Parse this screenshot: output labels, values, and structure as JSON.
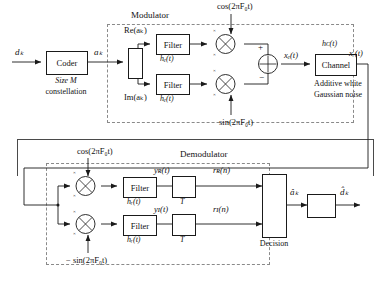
{
  "diagram": {
    "groups": {
      "modulator": "Modulator",
      "demodulator": "Demodulator"
    },
    "blocks": {
      "coder": "Coder",
      "coder_caption_line1": "Size M",
      "coder_caption_line2": "constellation",
      "splitter": "",
      "filter_i_tx": "Filter",
      "filter_q_tx": "Filter",
      "channel": "Channel",
      "channel_caption_line1": "Additive white",
      "channel_caption_line2": "Gaussian noise",
      "filter_i_rx": "Filter",
      "filter_q_rx": "Filter",
      "decision": "Decision",
      "decoder": ""
    },
    "signals": {
      "d_k": "dₖ",
      "a_k": "aₖ",
      "re_a_k": "Re(aₖ)",
      "im_a_k": "Im(aₖ)",
      "x_e": "xₑ(t)",
      "x_r": "xᵣ(t)",
      "y_R": "yʀ(t)",
      "y_I": "yɪ(t)",
      "r_R": "rʀ(n)",
      "r_I": "rɪ(n)",
      "a_hat": "âₖ",
      "d_hat": "d̂ₖ"
    },
    "impulse_responses": {
      "h_e_top": "hₑ(t)",
      "h_e_bottom": "hₑ(t)",
      "h_c": "hᴄ(t)",
      "h_r_top": "hᵣ(t)",
      "h_r_bottom": "hᵣ(t)"
    },
    "carriers": {
      "cos_tx": "cos(2πF₀t)",
      "sin_tx": "sin(2πF₀t)",
      "cos_rx": "cos(2πF₀t)",
      "minus_sin_rx": "− sin(2πF₀t)"
    },
    "samplers": {
      "period_top": "T",
      "period_bottom": "T"
    },
    "adder_signs": {
      "plus": "+",
      "minus": "−"
    },
    "mixer_marks": {
      "m1": "×",
      "m2": "×",
      "m3": "×",
      "m4": "×",
      "m5": "×",
      "m6": "×",
      "m7": "×",
      "m8": "×"
    },
    "colors": {
      "line": "#1a1a1a",
      "dashed_group": "#8a8a8a",
      "outer_box": "#4a4a4a",
      "background": "#ffffff"
    }
  }
}
